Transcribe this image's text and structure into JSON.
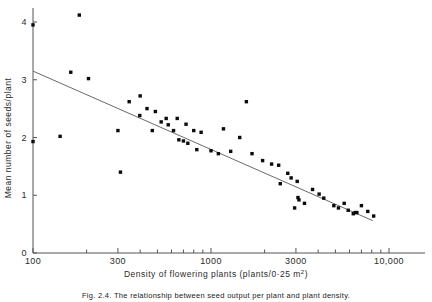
{
  "figure": {
    "xlabel": "Density of flowering plants (plants/0·25 m",
    "xlabel_sup": "2",
    "xlabel_tail": ")",
    "ylabel": "Mean number of seeds/plant",
    "caption": "Fig. 2.4.  The relationship between seed output per plant and plant density."
  },
  "chart_data": {
    "type": "scatter",
    "title": "",
    "xlabel": "Density of flowering plants (plants/0·25 m2)",
    "ylabel": "Mean number of seeds/plant",
    "xscale": "log",
    "yscale": "linear",
    "xlim": [
      100,
      10000
    ],
    "ylim": [
      0,
      4.3
    ],
    "grid": false,
    "legend": "none",
    "xticks_major": [
      100,
      300,
      1000,
      3000,
      10000
    ],
    "xticklabels": [
      "100",
      "300",
      "1000",
      "3000",
      "10,000"
    ],
    "xticks_minor": [
      200,
      400,
      500,
      600,
      700,
      800,
      900,
      2000,
      4000,
      5000,
      6000,
      7000,
      8000,
      9000
    ],
    "yticks": [
      0,
      1,
      2,
      3,
      4
    ],
    "yticklabels": [
      "0",
      "1",
      "2",
      "3",
      "4"
    ],
    "points": [
      {
        "x": 100,
        "y": 3.95
      },
      {
        "x": 100,
        "y": 1.93
      },
      {
        "x": 142,
        "y": 2.02
      },
      {
        "x": 182,
        "y": 4.12
      },
      {
        "x": 163,
        "y": 3.13
      },
      {
        "x": 205,
        "y": 3.02
      },
      {
        "x": 300,
        "y": 2.12
      },
      {
        "x": 310,
        "y": 1.4
      },
      {
        "x": 347,
        "y": 2.62
      },
      {
        "x": 400,
        "y": 2.72
      },
      {
        "x": 398,
        "y": 2.38
      },
      {
        "x": 437,
        "y": 2.5
      },
      {
        "x": 487,
        "y": 2.45
      },
      {
        "x": 468,
        "y": 2.12
      },
      {
        "x": 525,
        "y": 2.27
      },
      {
        "x": 560,
        "y": 2.33
      },
      {
        "x": 575,
        "y": 2.22
      },
      {
        "x": 616,
        "y": 2.12
      },
      {
        "x": 646,
        "y": 2.33
      },
      {
        "x": 660,
        "y": 1.96
      },
      {
        "x": 700,
        "y": 1.94
      },
      {
        "x": 724,
        "y": 2.23
      },
      {
        "x": 741,
        "y": 1.9
      },
      {
        "x": 800,
        "y": 2.12
      },
      {
        "x": 832,
        "y": 1.79
      },
      {
        "x": 880,
        "y": 2.09
      },
      {
        "x": 1000,
        "y": 1.77
      },
      {
        "x": 1100,
        "y": 1.72
      },
      {
        "x": 1175,
        "y": 2.15
      },
      {
        "x": 1290,
        "y": 1.76
      },
      {
        "x": 1450,
        "y": 2.0
      },
      {
        "x": 1580,
        "y": 2.62
      },
      {
        "x": 1700,
        "y": 1.72
      },
      {
        "x": 1950,
        "y": 1.6
      },
      {
        "x": 2190,
        "y": 1.54
      },
      {
        "x": 2400,
        "y": 1.52
      },
      {
        "x": 2450,
        "y": 1.2
      },
      {
        "x": 2700,
        "y": 1.38
      },
      {
        "x": 2820,
        "y": 1.3
      },
      {
        "x": 2950,
        "y": 0.78
      },
      {
        "x": 3050,
        "y": 1.24
      },
      {
        "x": 3080,
        "y": 0.96
      },
      {
        "x": 3120,
        "y": 0.92
      },
      {
        "x": 3350,
        "y": 0.86
      },
      {
        "x": 3720,
        "y": 1.1
      },
      {
        "x": 4050,
        "y": 1.02
      },
      {
        "x": 4300,
        "y": 0.95
      },
      {
        "x": 4900,
        "y": 0.82
      },
      {
        "x": 5200,
        "y": 0.78
      },
      {
        "x": 5600,
        "y": 0.86
      },
      {
        "x": 5900,
        "y": 0.74
      },
      {
        "x": 6300,
        "y": 0.68
      },
      {
        "x": 6450,
        "y": 0.7
      },
      {
        "x": 6600,
        "y": 0.7
      },
      {
        "x": 7000,
        "y": 0.82
      },
      {
        "x": 7600,
        "y": 0.72
      },
      {
        "x": 8200,
        "y": 0.64
      }
    ],
    "fit_line": {
      "label": "regression line",
      "x0": 100,
      "y0": 3.15,
      "x1": 8100,
      "y1": 0.56
    }
  }
}
